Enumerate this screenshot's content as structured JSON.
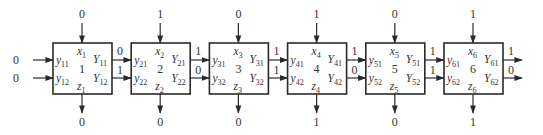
{
  "diagram": {
    "type": "cell-chain",
    "stages": [
      {
        "id": "1",
        "x_label": "x",
        "x_sub": "1",
        "top_input": "0",
        "bottom_output": "0",
        "y_in": [
          {
            "l": "y",
            "s": "11"
          },
          {
            "l": "y",
            "s": "12"
          }
        ],
        "Y_out": [
          {
            "l": "Y",
            "s": "11"
          },
          {
            "l": "Y",
            "s": "12"
          }
        ],
        "z_label": "z",
        "z_sub": "1",
        "left_inputs": [
          "0",
          "0"
        ],
        "right_outputs": [
          "0",
          "1"
        ]
      },
      {
        "id": "2",
        "x_label": "x",
        "x_sub": "2",
        "top_input": "1",
        "bottom_output": "0",
        "y_in": [
          {
            "l": "y",
            "s": "21"
          },
          {
            "l": "y",
            "s": "22"
          }
        ],
        "Y_out": [
          {
            "l": "Y",
            "s": "21"
          },
          {
            "l": "Y",
            "s": "22"
          }
        ],
        "z_label": "z",
        "z_sub": "2",
        "right_outputs": [
          "1",
          "0"
        ]
      },
      {
        "id": "3",
        "x_label": "x",
        "x_sub": "3",
        "top_input": "0",
        "bottom_output": "0",
        "y_in": [
          {
            "l": "y",
            "s": "31"
          },
          {
            "l": "y",
            "s": "32"
          }
        ],
        "Y_out": [
          {
            "l": "Y",
            "s": "31"
          },
          {
            "l": "Y",
            "s": "32"
          }
        ],
        "z_label": "z",
        "z_sub": "3",
        "right_outputs": [
          "1",
          "1"
        ]
      },
      {
        "id": "4",
        "x_label": "x",
        "x_sub": "4",
        "top_input": "1",
        "bottom_output": "1",
        "y_in": [
          {
            "l": "y",
            "s": "41"
          },
          {
            "l": "y",
            "s": "42"
          }
        ],
        "Y_out": [
          {
            "l": "Y",
            "s": "41"
          },
          {
            "l": "Y",
            "s": "42"
          }
        ],
        "z_label": "z",
        "z_sub": "4",
        "right_outputs": [
          "1",
          "0"
        ]
      },
      {
        "id": "5",
        "x_label": "x",
        "x_sub": "5",
        "top_input": "0",
        "bottom_output": "0",
        "y_in": [
          {
            "l": "y",
            "s": "51"
          },
          {
            "l": "y",
            "s": "52"
          }
        ],
        "Y_out": [
          {
            "l": "Y",
            "s": "51"
          },
          {
            "l": "Y",
            "s": "52"
          }
        ],
        "z_label": "z",
        "z_sub": "5",
        "right_outputs": [
          "1",
          "1"
        ]
      },
      {
        "id": "6",
        "x_label": "x",
        "x_sub": "6",
        "top_input": "1",
        "bottom_output": "1",
        "y_in": [
          {
            "l": "y",
            "s": "61"
          },
          {
            "l": "y",
            "s": "62"
          }
        ],
        "Y_out": [
          {
            "l": "Y",
            "s": "61"
          },
          {
            "l": "Y",
            "s": "62"
          }
        ],
        "z_label": "z",
        "z_sub": "6",
        "right_outputs": [
          "1",
          "0"
        ]
      }
    ],
    "colors": {
      "stroke": "#2a2a2a",
      "text": "#333333",
      "background": "#ffffff"
    }
  }
}
